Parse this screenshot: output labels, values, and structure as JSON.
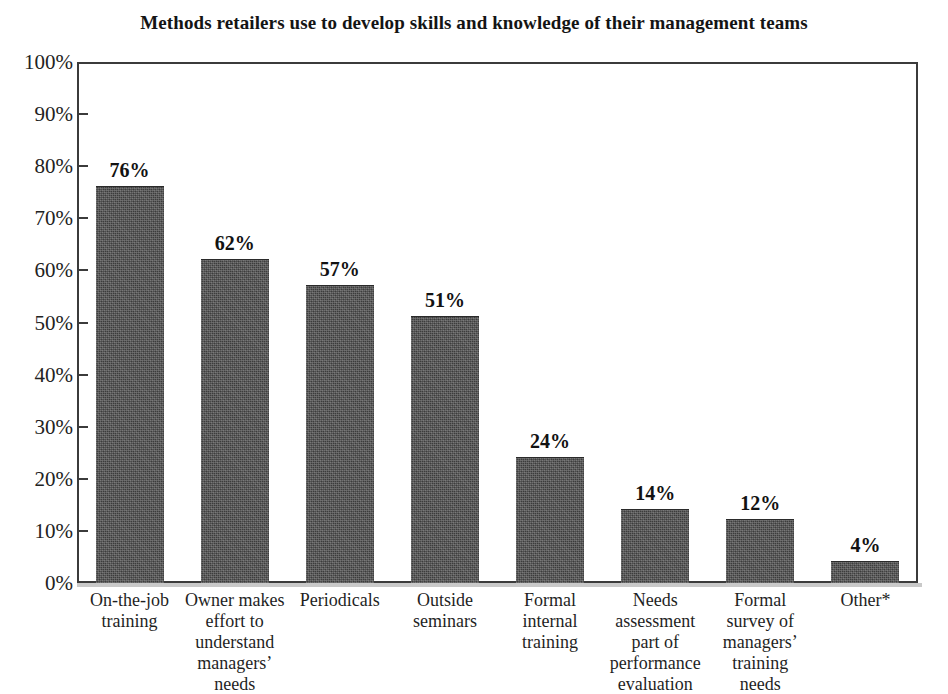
{
  "chart_data": {
    "type": "bar",
    "title": "Methods retailers use to develop skills and knowledge of their management teams",
    "xlabel": "",
    "ylabel": "",
    "ylim": [
      0,
      100
    ],
    "grid": false,
    "legend": "none",
    "orientation": "vertical",
    "bar_color": "#3c3c3c",
    "value_suffix": "%",
    "categories": [
      "On-the-job training",
      "Owner makes effort to understand managers’ needs",
      "Periodicals",
      "Outside seminars",
      "Formal internal training",
      "Needs assessment part of performance evaluation",
      "Formal survey of managers’ training needs",
      "Other*"
    ],
    "category_lines": [
      [
        "On-the-job",
        "training"
      ],
      [
        "Owner makes",
        "effort to",
        "understand",
        "managers’",
        "needs"
      ],
      [
        "Periodicals"
      ],
      [
        "Outside",
        "seminars"
      ],
      [
        "Formal",
        "internal",
        "training"
      ],
      [
        "Needs",
        "assessment",
        "part of",
        "performance",
        "evaluation"
      ],
      [
        "Formal",
        "survey of",
        "managers’",
        "training",
        "needs"
      ],
      [
        "Other*"
      ]
    ],
    "values": [
      76,
      62,
      57,
      51,
      24,
      14,
      12,
      4
    ],
    "value_labels": [
      "76%",
      "62%",
      "57%",
      "51%",
      "24%",
      "14%",
      "12%",
      "4%"
    ],
    "yticks": [
      0,
      10,
      20,
      30,
      40,
      50,
      60,
      70,
      80,
      90,
      100
    ],
    "ytick_labels": [
      "0%",
      "10%",
      "20%",
      "30%",
      "40%",
      "50%",
      "60%",
      "70%",
      "80%",
      "90%",
      "100%"
    ]
  }
}
